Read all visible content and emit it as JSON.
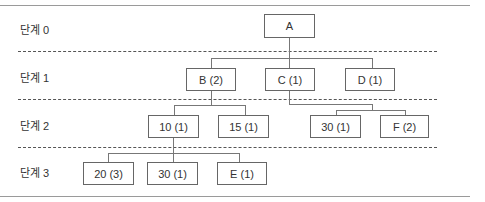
{
  "levels": [
    {
      "label": "단계 0"
    },
    {
      "label": "단계 1"
    },
    {
      "label": "단계 2"
    },
    {
      "label": "단계 3"
    }
  ],
  "nodes": {
    "a": "A",
    "b": "B (2)",
    "c": "C (1)",
    "d": "D (1)",
    "n10": "10 (1)",
    "n15": "15 (1)",
    "n30_2": "30 (1)",
    "f": "F (2)",
    "n20": "20 (3)",
    "n30_3": "30 (1)",
    "e": "E (1)"
  },
  "tree": {
    "A": [
      "B (2)",
      "C (1)",
      "D (1)"
    ],
    "B (2)": [
      "10 (1)",
      "15 (1)"
    ],
    "C (1)": [
      "30 (1)",
      "F (2)"
    ],
    "10 (1)": [
      "20 (3)",
      "30 (1)",
      "E (1)"
    ]
  }
}
